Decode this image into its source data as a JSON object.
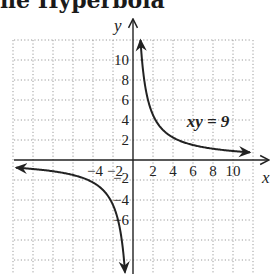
{
  "header": {
    "title_clipped": "ne Hyperbola"
  },
  "chart_data": {
    "type": "line",
    "title": "",
    "xlabel": "x",
    "ylabel": "y",
    "xlim": [
      -12,
      13.5
    ],
    "ylim": [
      -11.4,
      12
    ],
    "grid": true,
    "grid_style": "dotted",
    "x_ticks": [
      -4,
      -2,
      2,
      4,
      6,
      8,
      10
    ],
    "x_tick_labels": [
      "−4",
      "−2",
      "2",
      "4",
      "6",
      "8",
      "10"
    ],
    "y_ticks": [
      10,
      8,
      6,
      4,
      2,
      -2,
      -4,
      -6
    ],
    "y_tick_labels": [
      "10",
      "8",
      "6",
      "4",
      "2",
      "−2",
      "−4",
      "−6"
    ],
    "annotations": [
      {
        "text": "xy = 9",
        "x": 7.5,
        "y": 3.3
      }
    ],
    "series": [
      {
        "name": "xy = 9 (branch x>0)",
        "equation": "y = 9/x",
        "x_range": [
          0.75,
          11.7
        ],
        "arrows": "both"
      },
      {
        "name": "xy = 9 (branch x<0)",
        "equation": "y = 9/x",
        "x_range": [
          -11.7,
          -0.8
        ],
        "arrows": "both"
      }
    ]
  },
  "style": {
    "curve_color": "#222222",
    "grid_color": "#9a9a9a",
    "axis_color": "#222222"
  }
}
